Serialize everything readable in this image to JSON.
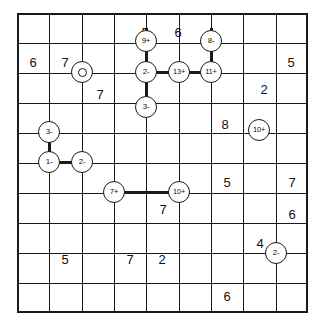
{
  "puzzle": {
    "type": "grid-puzzle",
    "grid": {
      "columns": 9,
      "rows": 10,
      "cell_width": 32.33,
      "cell_height": 30,
      "line_color": "#1a1a1a",
      "background_color": "#ffffff"
    },
    "cell_numbers": [
      {
        "id": "num-c4r1",
        "col": 4,
        "row": 1,
        "value": "5"
      },
      {
        "id": "num-c5r1",
        "col": 5,
        "row": 1,
        "value": "6"
      },
      {
        "id": "num-c1r2",
        "col": 1,
        "row": 2,
        "value": "6"
      },
      {
        "id": "num-c2r2",
        "col": 2,
        "row": 2,
        "value": "7"
      },
      {
        "id": "num-c9r2",
        "col": 9,
        "row": 2,
        "value": "5"
      },
      {
        "id": "num-c3r3",
        "col": 3,
        "row": 3,
        "value": "7"
      },
      {
        "id": "num-c8r3",
        "col": 8,
        "row": 3,
        "value": "2"
      },
      {
        "id": "num-c7r4",
        "col": 7,
        "row": 4,
        "value": "8"
      },
      {
        "id": "num-c7r6",
        "col": 7,
        "row": 6,
        "value": "5"
      },
      {
        "id": "num-c9r6",
        "col": 9,
        "row": 6,
        "value": "7"
      },
      {
        "id": "num-c5r7",
        "col": 5,
        "row": 7,
        "value": "7"
      },
      {
        "id": "num-c9r7",
        "col": 9,
        "row": 7,
        "value": "6"
      },
      {
        "id": "num-c8r8",
        "col": 8,
        "row": 8,
        "value": "4"
      },
      {
        "id": "num-c2r8",
        "col": 2,
        "row": 8,
        "value": "5"
      },
      {
        "id": "num-c4r8",
        "col": 4,
        "row": 8,
        "value": "7"
      },
      {
        "id": "num-c5r8",
        "col": 5,
        "row": 8,
        "value": "2"
      },
      {
        "id": "num-c7r9",
        "col": 7,
        "row": 9,
        "value": "6"
      }
    ],
    "nodes": [
      {
        "id": "node-9plus",
        "label": "9+",
        "col": 4,
        "row": 1
      },
      {
        "id": "node-8minus",
        "label": "8-",
        "col": 6,
        "row": 1
      },
      {
        "id": "node-o",
        "label": "",
        "col": 2,
        "row": 2,
        "style": "empty"
      },
      {
        "id": "node-2minus-top",
        "label": "2-",
        "col": 4,
        "row": 2
      },
      {
        "id": "node-13plus",
        "label": "13+",
        "col": 5,
        "row": 2
      },
      {
        "id": "node-11plus",
        "label": "11+",
        "col": 6,
        "row": 2
      },
      {
        "id": "node-3minus-top",
        "label": "3-",
        "col": 4,
        "row": 3
      },
      {
        "id": "node-10plus-right",
        "label": "10+",
        "col": 7,
        "row": 3
      },
      {
        "id": "node-3minus-left",
        "label": "3-",
        "col": 1,
        "row": 4
      },
      {
        "id": "node-1minus",
        "label": "1-",
        "col": 1,
        "row": 5
      },
      {
        "id": "node-2minus-left",
        "label": "2-",
        "col": 2,
        "row": 5
      },
      {
        "id": "node-7plus",
        "label": "7+",
        "col": 3,
        "row": 6
      },
      {
        "id": "node-10plus-mid",
        "label": "10+",
        "col": 5,
        "row": 6
      },
      {
        "id": "node-2minus-bottom",
        "label": "2-",
        "col": 8,
        "row": 7
      }
    ],
    "edges": [
      {
        "id": "edge-9plus-2minus",
        "from": "node-9plus",
        "to": "node-2minus-top",
        "orientation": "vertical"
      },
      {
        "id": "edge-8minus-11plus",
        "from": "node-8minus",
        "to": "node-11plus",
        "orientation": "vertical"
      },
      {
        "id": "edge-2minus-13plus",
        "from": "node-2minus-top",
        "to": "node-13plus",
        "orientation": "horizontal"
      },
      {
        "id": "edge-13plus-11plus",
        "from": "node-13plus",
        "to": "node-11plus",
        "orientation": "horizontal"
      },
      {
        "id": "edge-2minus-3minus",
        "from": "node-2minus-top",
        "to": "node-3minus-top",
        "orientation": "vertical"
      },
      {
        "id": "edge-3minus-1minus",
        "from": "node-3minus-left",
        "to": "node-1minus",
        "orientation": "vertical"
      },
      {
        "id": "edge-1minus-2minus",
        "from": "node-1minus",
        "to": "node-2minus-left",
        "orientation": "horizontal"
      },
      {
        "id": "edge-7plus-10plus",
        "from": "node-7plus",
        "to": "node-10plus-mid",
        "orientation": "horizontal"
      }
    ]
  }
}
